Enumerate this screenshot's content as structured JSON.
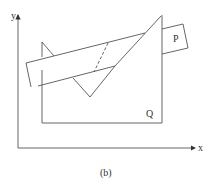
{
  "figure": {
    "caption": "(b)",
    "axes": {
      "x_label": "x",
      "y_label": "y"
    },
    "shapes": {
      "P": {
        "label": "P",
        "description": "rectangular band (strip) passing over shape Q"
      },
      "Q": {
        "label": "Q",
        "description": "polygon with spiked top and V-shaped notch"
      }
    },
    "annotations": [
      "dashed line indicating hidden edge of P behind Q"
    ],
    "colors": {
      "stroke": "#444444",
      "background": "#ffffff"
    }
  }
}
